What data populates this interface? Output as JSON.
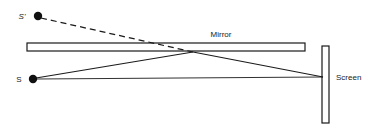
{
  "diagram": {
    "background_color": "#ffffff",
    "stroke_color": "#1a1a1a",
    "labels": {
      "source_image": "S'",
      "source": "S",
      "mirror": "Mirror",
      "screen": "Screen"
    },
    "points": {
      "source_image": {
        "x": 38,
        "y": 16,
        "radius": 4.2
      },
      "source": {
        "x": 33,
        "y": 79,
        "radius": 4.2
      },
      "reflection": {
        "x": 193,
        "y": 52
      },
      "screen_hit": {
        "x": 323,
        "y": 77
      }
    },
    "label_positions": {
      "source_image": {
        "x": 22,
        "y": 19
      },
      "source": {
        "x": 19,
        "y": 82
      },
      "mirror": {
        "x": 221,
        "y": 37
      },
      "screen": {
        "x": 336,
        "y": 80
      }
    },
    "mirror": {
      "x": 27,
      "y": 43,
      "width": 278,
      "height": 8,
      "fill": "#ffffff",
      "stroke": "#1a1a1a",
      "stroke_width": 1.2
    },
    "screen": {
      "x": 322,
      "y": 46,
      "width": 7,
      "height": 77,
      "fill": "#ffffff",
      "stroke": "#1a1a1a",
      "stroke_width": 1.2
    },
    "rays": [
      {
        "name": "virtual-ray-from-image",
        "style": "dashed",
        "dash_pattern": "6,4",
        "from": {
          "x": 41,
          "y": 18
        },
        "to": {
          "x": 193,
          "y": 52
        }
      },
      {
        "name": "incident-ray-source-to-mirror",
        "style": "solid",
        "from": {
          "x": 36,
          "y": 78
        },
        "to": {
          "x": 193,
          "y": 52
        }
      },
      {
        "name": "reflected-ray-mirror-to-screen",
        "style": "solid",
        "from": {
          "x": 193,
          "y": 52
        },
        "to": {
          "x": 323,
          "y": 77
        }
      },
      {
        "name": "direct-ray-source-to-screen",
        "style": "solid",
        "from": {
          "x": 36,
          "y": 79
        },
        "to": {
          "x": 323,
          "y": 77
        }
      }
    ]
  }
}
